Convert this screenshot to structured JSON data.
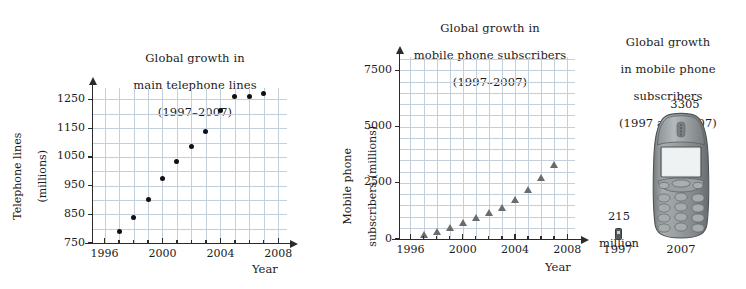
{
  "chart_data": [
    {
      "type": "scatter",
      "title": "Global growth in\nmain telephone lines\n(1997–2007)",
      "title_lines": [
        "Global growth in",
        "main telephone lines",
        "(1997–2007)"
      ],
      "xlabel": "Year",
      "ylabel": "Telephone lines\n(millions)",
      "ylabel_lines": [
        "Telephone lines",
        "(millions)"
      ],
      "xlim": [
        1995.2,
        2008.6
      ],
      "ylim": [
        750,
        1290
      ],
      "xticks": [
        1996,
        2000,
        2004,
        2008
      ],
      "xtick_labels": [
        "1996",
        "2000",
        "2004",
        "2008"
      ],
      "yticks": [
        750,
        850,
        950,
        1050,
        1150,
        1250
      ],
      "ytick_labels": [
        "750",
        "850",
        "950",
        "1050",
        "1150",
        "1250"
      ],
      "grid": true,
      "grid_x_step": 1,
      "grid_y_step": 50,
      "marker": "circle",
      "marker_color": "#111111",
      "x": [
        1997,
        1998,
        1999,
        2000,
        2001,
        2002,
        2003,
        2004,
        2005,
        2006,
        2007
      ],
      "values": [
        790,
        838,
        903,
        973,
        1035,
        1085,
        1140,
        1210,
        1259,
        1260,
        1270
      ]
    },
    {
      "type": "scatter",
      "title": "Global growth in\nmobile phone subscribers\n(1997–2007)",
      "title_lines": [
        "Global growth in",
        "mobile phone subscribers",
        "(1997–2007)"
      ],
      "xlabel": "Year",
      "ylabel": "Mobile phone\nsubscribers (millions)",
      "ylabel_lines": [
        "Mobile phone",
        "subscribers (millions)"
      ],
      "xlim": [
        1995.2,
        2008.6
      ],
      "ylim": [
        0,
        8100
      ],
      "xticks": [
        1996,
        2000,
        2004,
        2008
      ],
      "xtick_labels": [
        "1996",
        "2000",
        "2004",
        "2008"
      ],
      "yticks": [
        0,
        2500,
        5000,
        7500
      ],
      "ytick_labels": [
        "0",
        "2500",
        "5000",
        "7500"
      ],
      "grid": true,
      "grid_x_step": 1,
      "grid_y_step": 500,
      "marker": "triangle",
      "marker_color": "#6b6b6b",
      "x": [
        1997,
        1998,
        1999,
        2000,
        2001,
        2002,
        2003,
        2004,
        2005,
        2006,
        2007
      ],
      "values": [
        215,
        320,
        490,
        740,
        955,
        1160,
        1420,
        1760,
        2210,
        2720,
        3305
      ]
    },
    {
      "type": "pictogram",
      "title": "Global growth\nin mobile phone\nsubscribers\n(1997 and 2007)",
      "title_lines": [
        "Global growth",
        "in mobile phone",
        "subscribers",
        "(1997 and 2007)"
      ],
      "categories": [
        "1997",
        "2007"
      ],
      "values": [
        215,
        3305
      ],
      "value_labels": [
        "215\nmillion",
        "3305\nmillion"
      ],
      "unit": "million",
      "icon": "mobile-phone-icon"
    }
  ],
  "colors": {
    "grid": "#c3cfda",
    "axis": "#2b2b2b",
    "dot_marker": "#111111",
    "triangle_marker": "#6b6b6b",
    "text": "#1c1c1c",
    "phone_body": "#8e9496",
    "phone_screen": "#e8ecec",
    "background": "#ffffff"
  },
  "chart1": {
    "title_l1": "Global growth in",
    "title_l2": "main telephone lines",
    "title_l3": "(1997–2007)",
    "ylabel_l1": "Telephone lines",
    "ylabel_l2": "(millions)",
    "xlabel": "Year",
    "yticks": [
      "1250",
      "1150",
      "1050",
      "950",
      "850",
      "750"
    ],
    "xticks": [
      "1996",
      "2000",
      "2004",
      "2008"
    ]
  },
  "chart2": {
    "title_l1": "Global growth in",
    "title_l2": "mobile phone subscribers",
    "title_l3": "(1997–2007)",
    "ylabel_l1": "Mobile phone",
    "ylabel_l2": "subscribers (millions)",
    "xlabel": "Year",
    "yticks": [
      "7500",
      "5000",
      "2500",
      "0"
    ],
    "xticks": [
      "1996",
      "2000",
      "2004",
      "2008"
    ]
  },
  "chart3": {
    "title_l1": "Global growth",
    "title_l2": "in mobile phone",
    "title_l3": "subscribers",
    "title_l4": "(1997 and 2007)",
    "big_value_l1": "3305",
    "big_value_l2": "million",
    "small_value_l1": "215",
    "small_value_l2": "million",
    "year_1997": "1997",
    "year_2007": "2007"
  }
}
